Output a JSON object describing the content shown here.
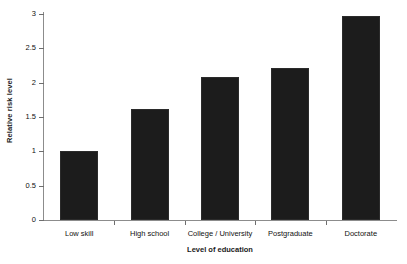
{
  "chart_data": {
    "type": "bar",
    "title": "",
    "xlabel": "Level of education",
    "ylabel": "Relative risk level",
    "categories": [
      "Low skill",
      "High school",
      "College / University",
      "Postgraduate",
      "Doctorate"
    ],
    "values": [
      1.0,
      1.62,
      2.08,
      2.21,
      2.97
    ],
    "ylim": [
      0,
      3
    ],
    "yticks": [
      0,
      0.5,
      1,
      1.5,
      2,
      2.5,
      3
    ],
    "ytick_labels": [
      "0",
      "0.5",
      "1",
      "1.5",
      "2",
      "2.5",
      "3"
    ],
    "grid": false,
    "legend": null,
    "legend_position": "none",
    "bar_color": "#1c1c1c",
    "axis_color": "#8c8c8c",
    "background_color": "#ffffff"
  }
}
